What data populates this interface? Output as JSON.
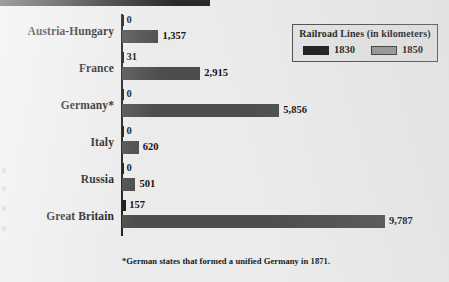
{
  "chart_data": {
    "type": "bar",
    "orientation": "horizontal",
    "title": "Railroad Lines (in kilometers)",
    "xlabel": "",
    "ylabel": "",
    "categories": [
      "Austria-Hungary",
      "France",
      "Germany*",
      "Italy",
      "Russia",
      "Great Britain"
    ],
    "series": [
      {
        "name": "1830",
        "color": "#181818",
        "values": [
          0,
          31,
          0,
          0,
          0,
          157
        ],
        "labels": [
          "0",
          "31",
          "0",
          "0",
          "0",
          "157"
        ]
      },
      {
        "name": "1850",
        "color": "#4d4d4d",
        "values": [
          1357,
          2915,
          5856,
          620,
          501,
          9787
        ],
        "labels": [
          "1,357",
          "2,915",
          "5,856",
          "620",
          "501",
          "9,787"
        ]
      }
    ],
    "xlim": [
      0,
      9787
    ],
    "grid": false,
    "legend_position": "top-right",
    "annotations": [
      "*German states that formed a unified Germany in 1871."
    ]
  },
  "legend": {
    "title": "Railroad Lines (in kilometers)",
    "entries": [
      {
        "label": "1830",
        "swatch": "swatch-1830"
      },
      {
        "label": "1850",
        "swatch": "swatch-1850"
      }
    ]
  },
  "footnote": "*German states that formed a unified Germany in 1871."
}
